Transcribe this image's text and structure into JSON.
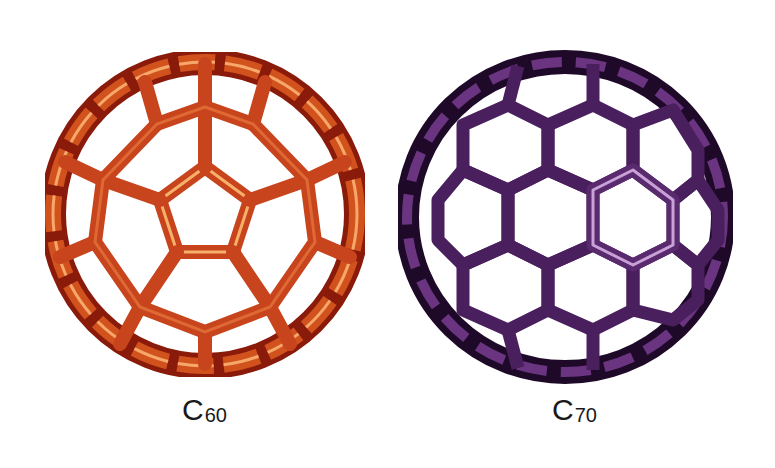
{
  "figure": {
    "molecules": [
      {
        "id": "c60",
        "label_element": "C",
        "label_subscript": "60",
        "color_main": "#c8441c",
        "color_dark": "#8a1a0a",
        "color_highlight": "#f7b06a",
        "shape": "truncated-icosahedron"
      },
      {
        "id": "c70",
        "label_element": "C",
        "label_subscript": "70",
        "color_main": "#5a2a6e",
        "color_dark": "#1e0a28",
        "color_highlight": "#c9a0d8",
        "shape": "ellipsoid-fullerene"
      }
    ]
  }
}
